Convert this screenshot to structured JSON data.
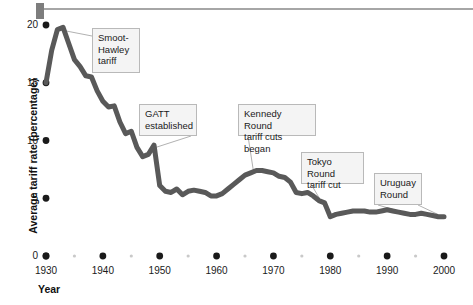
{
  "figure": {
    "background_color": "#ffffff",
    "line_color": "#595959",
    "callout_fill": "#f4f4f4",
    "callout_border": "#b9b9b9",
    "tick_color": "#1a1a1a",
    "minor_tick_color": "#c9c9c9"
  },
  "chart_data": {
    "type": "line",
    "title": "",
    "xlabel": "Year",
    "ylabel": "Average tariff rate (percentage)",
    "xlim": [
      1930,
      2000
    ],
    "ylim": [
      0,
      21
    ],
    "grid": false,
    "legend": "none",
    "x_ticks": [
      1930,
      1940,
      1950,
      1960,
      1970,
      1980,
      1990,
      2000
    ],
    "x_minor_ticks": [
      1935,
      1945,
      1955,
      1965,
      1975,
      1985,
      1995
    ],
    "y_ticks": [
      0,
      5,
      10,
      15,
      20
    ],
    "series": [
      {
        "name": "Average tariff rate",
        "x": [
          1930,
          1931,
          1932,
          1933,
          1934,
          1935,
          1936,
          1937,
          1938,
          1939,
          1940,
          1941,
          1942,
          1943,
          1944,
          1945,
          1946,
          1947,
          1948,
          1949,
          1950,
          1951,
          1952,
          1953,
          1954,
          1955,
          1956,
          1957,
          1958,
          1959,
          1960,
          1961,
          1962,
          1963,
          1964,
          1965,
          1966,
          1967,
          1968,
          1969,
          1970,
          1971,
          1972,
          1973,
          1974,
          1975,
          1976,
          1977,
          1978,
          1979,
          1980,
          1981,
          1982,
          1983,
          1984,
          1985,
          1986,
          1987,
          1988,
          1989,
          1990,
          1991,
          1992,
          1993,
          1994,
          1995,
          1996,
          1997,
          1998,
          1999,
          2000
        ],
        "y": [
          15.0,
          17.8,
          19.6,
          19.8,
          18.4,
          17.0,
          16.4,
          15.6,
          15.5,
          14.3,
          13.4,
          12.9,
          13.0,
          11.6,
          10.6,
          10.8,
          9.4,
          8.6,
          8.8,
          9.6,
          6.1,
          5.6,
          5.5,
          5.8,
          5.3,
          5.6,
          5.7,
          5.6,
          5.5,
          5.2,
          5.2,
          5.4,
          5.8,
          6.2,
          6.6,
          7.0,
          7.2,
          7.4,
          7.4,
          7.3,
          7.2,
          6.9,
          6.8,
          6.4,
          5.5,
          5.4,
          5.5,
          5.2,
          4.8,
          4.6,
          3.4,
          3.6,
          3.7,
          3.8,
          3.9,
          3.9,
          3.9,
          3.8,
          3.8,
          3.9,
          4.0,
          3.9,
          3.8,
          3.7,
          3.6,
          3.6,
          3.7,
          3.6,
          3.5,
          3.4,
          3.4
        ]
      }
    ],
    "annotations": [
      {
        "id": "smoot-hawley",
        "text": "Smoot-\nHawley\ntariff",
        "point_year": 1932,
        "point_value": 19.6
      },
      {
        "id": "gatt",
        "text": "GATT\nestablished",
        "point_year": 1947,
        "point_value": 8.6
      },
      {
        "id": "kennedy-round",
        "text": "Kennedy Round\ntariff cuts began",
        "point_year": 1967,
        "point_value": 7.4
      },
      {
        "id": "tokyo-round",
        "text": "Tokyo Round\ntariff cut",
        "point_year": 1980,
        "point_value": 3.4
      },
      {
        "id": "uruguay-round",
        "text": "Uruguay\nRound",
        "point_year": 1994,
        "point_value": 3.6
      }
    ]
  },
  "axis": {
    "y_title": "Average tariff rate (percentage)",
    "x_title": "Year",
    "y_tick_labels": [
      "0",
      "5",
      "10",
      "15",
      "20"
    ],
    "x_tick_labels": [
      "1930",
      "1940",
      "1950",
      "1960",
      "1970",
      "1980",
      "1990",
      "2000"
    ]
  },
  "callouts": {
    "smoot_hawley": "Smoot-\nHawley\ntariff",
    "gatt": "GATT\nestablished",
    "kennedy": "Kennedy Round\ntariff cuts began",
    "tokyo": "Tokyo Round\ntariff cut",
    "uruguay": "Uruguay\nRound"
  }
}
